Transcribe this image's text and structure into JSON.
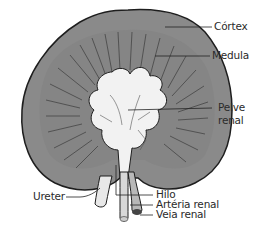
{
  "diagram": {
    "colors": {
      "cortex": "#8a8a8a",
      "medulla_lines": "#3a3a3a",
      "pelvis": "#f2f2f2",
      "outline": "#1e1e1e",
      "leader": "#222222"
    },
    "labels": {
      "cortex": "Córtex",
      "medula": "Medula",
      "pelve_line1": "Pelve",
      "pelve_line2": "renal",
      "ureter": "Ureter",
      "hilo": "Hilo",
      "arteria": "Artéria renal",
      "veia": "Veia renal"
    }
  }
}
